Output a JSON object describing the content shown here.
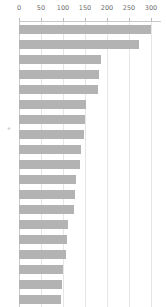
{
  "chart_data": {
    "type": "bar",
    "orientation": "horizontal",
    "title": "",
    "subtitle": "",
    "xlabel": "",
    "ylabel": "a",
    "xlim": [
      0,
      300
    ],
    "ylim": null,
    "grid": true,
    "legend": null,
    "axis_position": "top",
    "xticks": [
      0,
      50,
      100,
      150,
      200,
      250,
      300
    ],
    "xticklabels": [
      "0",
      "50",
      "100",
      "150",
      "200",
      "250",
      "300"
    ],
    "yticklabels": [],
    "bar_color": "#b3b3b3",
    "grid_color": "#e6e6e6",
    "axis_color": "#c9c9c9",
    "tick_label_color": "#6e6e6e",
    "categories": [
      "1",
      "2",
      "3",
      "4",
      "5",
      "6",
      "7",
      "8",
      "9",
      "10",
      "11",
      "12",
      "13",
      "14",
      "15",
      "16",
      "17",
      "18",
      "19"
    ],
    "values": [
      300,
      272,
      186,
      182,
      180,
      152,
      150,
      148,
      140,
      138,
      130,
      128,
      126,
      112,
      110,
      106,
      100,
      98,
      96
    ],
    "series": [
      {
        "name": "",
        "values": [
          300,
          272,
          186,
          182,
          180,
          152,
          150,
          148,
          140,
          138,
          130,
          128,
          126,
          112,
          110,
          106,
          100,
          98,
          96
        ]
      }
    ]
  }
}
